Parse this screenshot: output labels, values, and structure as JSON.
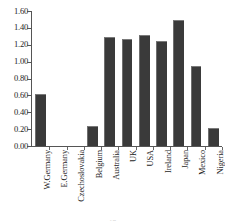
{
  "chart_data": {
    "type": "bar",
    "title": "",
    "xlabel": "",
    "ylabel": "",
    "categories": [
      "W.Germany",
      "E.Germany",
      "Czechoslovakia",
      "Belgium",
      "Australia",
      "UK",
      "USA",
      "Ireland",
      "Japan",
      "Mexico",
      "Nigeria"
    ],
    "values": [
      0.62,
      0.0,
      0.0,
      0.24,
      1.29,
      1.27,
      1.32,
      1.25,
      1.49,
      0.95,
      0.21
    ],
    "ylim": [
      0.0,
      1.6
    ],
    "ytick_step": 0.2,
    "ytick_labels": [
      "1.60",
      "1.40",
      "1.20",
      "1.00",
      "0.80",
      "0.60",
      "0.40",
      "0.20",
      "0.00"
    ],
    "ytick_values": [
      1.6,
      1.4,
      1.2,
      1.0,
      0.8,
      0.6,
      0.4,
      0.2,
      0.0
    ],
    "grid": false,
    "legend": null,
    "bar_color": "#3a3a3a",
    "axis_color": "#555555"
  },
  "footer": {
    "mark": "17"
  }
}
